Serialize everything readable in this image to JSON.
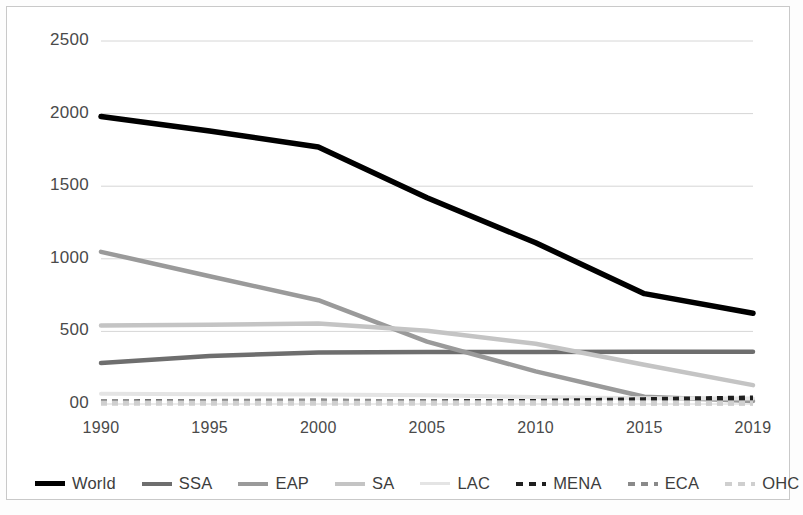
{
  "chart_data": {
    "type": "line",
    "title": "",
    "subtitle": "",
    "xlabel": "",
    "ylabel": "",
    "x": [
      1990,
      1995,
      2000,
      2005,
      2010,
      2015,
      2019
    ],
    "x_tick_labels": [
      "1990",
      "1995",
      "2000",
      "2005",
      "2010",
      "2015",
      "2019"
    ],
    "y_tick_labels": [
      "2500",
      "2000",
      "1500",
      "1000",
      "500",
      "00"
    ],
    "y_tick_values": [
      2500,
      2000,
      1500,
      1000,
      500,
      0
    ],
    "ylim": [
      0,
      2750
    ],
    "xlim": [
      1990,
      2019
    ],
    "grid": true,
    "grid_axis": "y",
    "legend_position": "bottom",
    "series": [
      {
        "name": "World",
        "color": "#000000",
        "width": 5.5,
        "dash": "none",
        "values": [
          1980,
          1880,
          1770,
          1420,
          1110,
          760,
          625
        ]
      },
      {
        "name": "SSA",
        "color": "#6e6e6e",
        "width": 4.5,
        "dash": "none",
        "values": [
          282,
          330,
          355,
          358,
          358,
          360,
          360
        ]
      },
      {
        "name": "EAP",
        "color": "#9a9a9a",
        "width": 4.5,
        "dash": "none",
        "values": [
          1048,
          880,
          715,
          430,
          225,
          50,
          20
        ]
      },
      {
        "name": "SA",
        "color": "#c4c4c4",
        "width": 4.5,
        "dash": "none",
        "values": [
          540,
          545,
          555,
          505,
          415,
          270,
          130
        ]
      },
      {
        "name": "LAC",
        "color": "#e4e4e4",
        "width": 4,
        "dash": "none",
        "values": [
          70,
          68,
          65,
          60,
          48,
          40,
          38
        ]
      },
      {
        "name": "MENA",
        "color": "#1f1f1f",
        "width": 5,
        "dash": "dashed",
        "values": [
          14,
          16,
          16,
          16,
          18,
          30,
          42
        ]
      },
      {
        "name": "ECA",
        "color": "#8a8a8a",
        "width": 5,
        "dash": "dashed",
        "values": [
          10,
          18,
          22,
          14,
          10,
          8,
          8
        ]
      },
      {
        "name": "OHC",
        "color": "#cfcfcf",
        "width": 5,
        "dash": "dashed",
        "values": [
          6,
          6,
          6,
          6,
          6,
          6,
          6
        ]
      }
    ]
  },
  "legend": {
    "entries": [
      {
        "label": "World"
      },
      {
        "label": "SSA"
      },
      {
        "label": "EAP"
      },
      {
        "label": "SA"
      },
      {
        "label": "LAC"
      },
      {
        "label": "MENA"
      },
      {
        "label": "ECA"
      },
      {
        "label": "OHC"
      }
    ]
  },
  "colors": {
    "background": "#ffffff",
    "border": "#c9c9c9",
    "gridline": "#d6d6d6",
    "tick_text": "#4a4a4a"
  }
}
